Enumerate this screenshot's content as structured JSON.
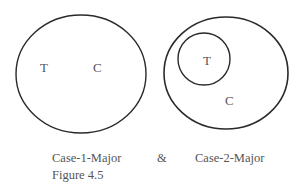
{
  "diagram": {
    "case1": {
      "outer_label": "C",
      "inner_label": "T",
      "name": "Case-1-Major"
    },
    "case2": {
      "outer_label": "C",
      "inner_label": "T",
      "name": "Case-2-Major"
    },
    "connector": "&",
    "figure_label": "Figure 4.5",
    "stroke_color": "#2a2a2a",
    "text_color": "#555555"
  }
}
